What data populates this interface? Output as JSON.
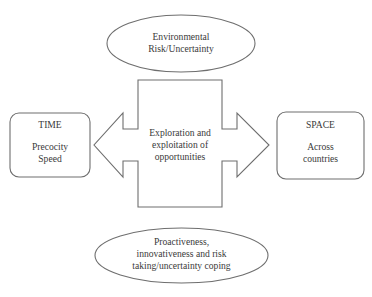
{
  "diagram": {
    "top_ellipse": {
      "lines": [
        "Environmental",
        "Risk/Uncertainty"
      ]
    },
    "center": {
      "lines": [
        "Exploration and",
        "exploitation of",
        "opportunities"
      ]
    },
    "left_box": {
      "title": "TIME",
      "lines": [
        "Precocity",
        "Speed"
      ]
    },
    "right_box": {
      "title": "SPACE",
      "lines": [
        "Across",
        "countries"
      ]
    },
    "bottom_ellipse": {
      "lines": [
        "Proactiveness,",
        "innovativeness and risk",
        "taking/uncertainty coping"
      ]
    },
    "colors": {
      "stroke": "#6e6e6e",
      "text": "#3a3a3a",
      "background": "#ffffff"
    }
  }
}
